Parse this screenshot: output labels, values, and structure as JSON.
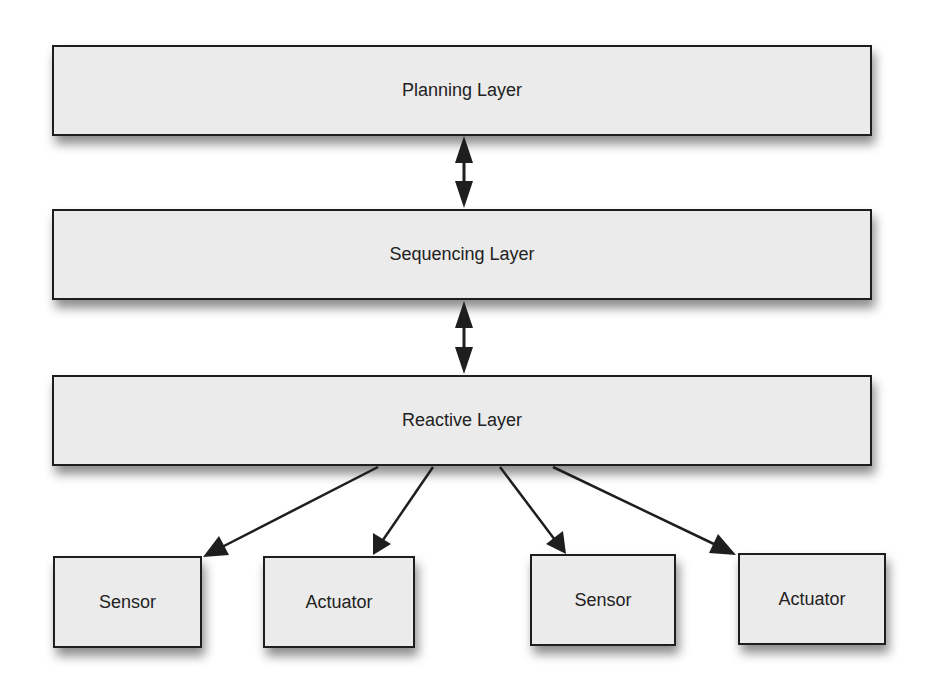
{
  "diagram": {
    "layers": [
      {
        "id": "planning",
        "label": "Planning Layer"
      },
      {
        "id": "sequencing",
        "label": "Sequencing Layer"
      },
      {
        "id": "reactive",
        "label": "Reactive Layer"
      }
    ],
    "devices": [
      {
        "id": "sensor-1",
        "label": "Sensor"
      },
      {
        "id": "actuator-1",
        "label": "Actuator"
      },
      {
        "id": "sensor-2",
        "label": "Sensor"
      },
      {
        "id": "actuator-2",
        "label": "Actuator"
      }
    ],
    "connections": [
      {
        "from": "Planning Layer",
        "to": "Sequencing Layer",
        "type": "bidirectional"
      },
      {
        "from": "Sequencing Layer",
        "to": "Reactive Layer",
        "type": "bidirectional"
      },
      {
        "from": "Reactive Layer",
        "to": "Sensor",
        "type": "directed"
      },
      {
        "from": "Reactive Layer",
        "to": "Actuator",
        "type": "directed"
      },
      {
        "from": "Reactive Layer",
        "to": "Sensor",
        "type": "directed"
      },
      {
        "from": "Reactive Layer",
        "to": "Actuator",
        "type": "directed"
      }
    ],
    "colors": {
      "box_fill": "#ebebeb",
      "box_border": "#1e1e1e",
      "arrow": "#1e1e1e",
      "text": "#222222",
      "background": "#ffffff"
    }
  }
}
